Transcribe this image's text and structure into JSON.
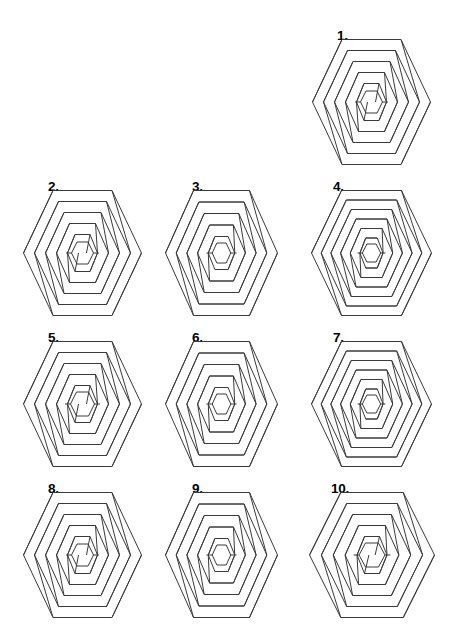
{
  "page": {
    "kind": "puzzle-worksheet",
    "background_color": "#ffffff",
    "ink_color": "#3a3a3a",
    "label_color": "#000000",
    "width": 459,
    "height": 628,
    "cropped_top_text": ". .   . ."
  },
  "chart_data": {
    "type": "table",
    "title": "",
    "xlabel": "",
    "ylabel": "",
    "categories": [
      "1.",
      "2.",
      "3.",
      "4.",
      "5.",
      "6.",
      "7.",
      "8.",
      "9.",
      "10."
    ],
    "values": [
      5,
      5,
      5,
      6,
      5,
      5,
      6,
      5,
      5,
      5
    ]
  },
  "figures": [
    {
      "label": "1.",
      "label_x": 337,
      "label_y": 29,
      "x": 311,
      "y": 38,
      "w": 121,
      "h": 128,
      "rings": 5,
      "ring_step": 11.0,
      "aspect": 1.0,
      "inner_radius": 11,
      "row": 1,
      "column": 3
    },
    {
      "label": "2.",
      "label_x": 48,
      "label_y": 180,
      "x": 22,
      "y": 189,
      "w": 121,
      "h": 128,
      "rings": 5,
      "ring_step": 11.0,
      "aspect": 1.0,
      "inner_radius": 11,
      "row": 2,
      "column": 1
    },
    {
      "label": "3.",
      "label_x": 192,
      "label_y": 180,
      "x": 164,
      "y": 189,
      "w": 115,
      "h": 128,
      "rings": 5,
      "ring_step": 11.5,
      "aspect": 0.93,
      "inner_radius": 10,
      "row": 2,
      "column": 2
    },
    {
      "label": "4.",
      "label_x": 333,
      "label_y": 180,
      "x": 310,
      "y": 189,
      "w": 123,
      "h": 128,
      "rings": 6,
      "ring_step": 9.5,
      "aspect": 1.02,
      "inner_radius": 9,
      "row": 2,
      "column": 3
    },
    {
      "label": "5.",
      "label_x": 48,
      "label_y": 331,
      "x": 22,
      "y": 340,
      "w": 121,
      "h": 128,
      "rings": 5,
      "ring_step": 11.0,
      "aspect": 1.0,
      "inner_radius": 12,
      "row": 3,
      "column": 1
    },
    {
      "label": "6.",
      "label_x": 192,
      "label_y": 331,
      "x": 164,
      "y": 340,
      "w": 115,
      "h": 128,
      "rings": 5,
      "ring_step": 11.5,
      "aspect": 0.93,
      "inner_radius": 10,
      "row": 3,
      "column": 2
    },
    {
      "label": "7.",
      "label_x": 333,
      "label_y": 331,
      "x": 310,
      "y": 340,
      "w": 123,
      "h": 128,
      "rings": 6,
      "ring_step": 9.5,
      "aspect": 1.02,
      "inner_radius": 9,
      "row": 3,
      "column": 3
    },
    {
      "label": "8.",
      "label_x": 48,
      "label_y": 482,
      "x": 22,
      "y": 491,
      "w": 121,
      "h": 128,
      "rings": 5,
      "ring_step": 11.0,
      "aspect": 1.0,
      "inner_radius": 11,
      "row": 4,
      "column": 1
    },
    {
      "label": "9.",
      "label_x": 192,
      "label_y": 482,
      "x": 164,
      "y": 491,
      "w": 115,
      "h": 128,
      "rings": 5,
      "ring_step": 11.5,
      "aspect": 0.93,
      "inner_radius": 10,
      "row": 4,
      "column": 2
    },
    {
      "label": "10.",
      "label_x": 331,
      "label_y": 482,
      "x": 308,
      "y": 491,
      "w": 128,
      "h": 128,
      "rings": 5,
      "ring_step": 11.0,
      "aspect": 1.08,
      "inner_radius": 12,
      "row": 4,
      "column": 3
    }
  ]
}
